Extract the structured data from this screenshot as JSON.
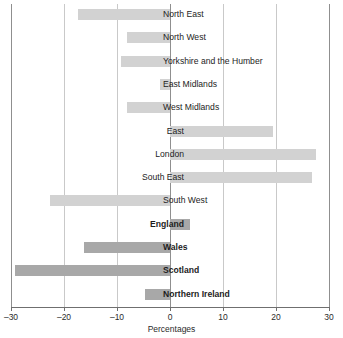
{
  "chart_data": {
    "type": "bar",
    "orientation": "horizontal",
    "title": "",
    "subtitle": "",
    "xlabel": "Percentages",
    "ylabel": "",
    "xlim": [
      -30,
      30
    ],
    "tick_labels": [
      "–30",
      "–20",
      "–10",
      "0",
      "10",
      "20",
      "30"
    ],
    "tick_values": [
      -30,
      -20,
      -10,
      0,
      10,
      20,
      30
    ],
    "grid": true,
    "legend": "none",
    "categories": [
      "North East",
      "North West",
      "Yorkshire  and the Humber",
      "East Midlands",
      "West Midlands",
      "East",
      "London",
      "South East",
      "South West",
      "England",
      "Wales",
      "Scotland",
      "Northern Ireland"
    ],
    "values": [
      -17.3,
      -8.2,
      -9.2,
      -1.9,
      -8.2,
      19.4,
      27.6,
      26.8,
      -22.6,
      3.8,
      -16.2,
      -29.3,
      -4.8
    ],
    "series": [
      {
        "name": "Percentage change",
        "values": [
          -17.3,
          -8.2,
          -9.2,
          -1.9,
          -8.2,
          19.4,
          27.6,
          26.8,
          -22.6,
          3.8,
          -16.2,
          -29.3,
          -4.8
        ]
      }
    ],
    "bar_styles": [
      "region",
      "region",
      "region",
      "region",
      "region",
      "region",
      "region",
      "region",
      "region",
      "country",
      "country",
      "country",
      "country"
    ],
    "bold_labels": [
      false,
      false,
      false,
      false,
      false,
      false,
      false,
      false,
      false,
      true,
      true,
      true,
      true
    ],
    "colors": {
      "region_bar": "#d2d2d2",
      "country_bar": "#a8a8a8",
      "gridline": "#c9c9c9",
      "axis": "#6f6f6f",
      "text": "#1d1d1d"
    }
  },
  "rows": [
    {
      "label": "North East",
      "value": -17.3,
      "style": "region",
      "bold": false
    },
    {
      "label": "North West",
      "value": -8.2,
      "style": "region",
      "bold": false
    },
    {
      "label": "Yorkshire  and the Humber",
      "value": -9.2,
      "style": "region",
      "bold": false
    },
    {
      "label": "East Midlands",
      "value": -1.9,
      "style": "region",
      "bold": false
    },
    {
      "label": "West Midlands",
      "value": -8.2,
      "style": "region",
      "bold": false
    },
    {
      "label": "East",
      "value": 19.4,
      "style": "region",
      "bold": false
    },
    {
      "label": "London",
      "value": 27.6,
      "style": "region",
      "bold": false
    },
    {
      "label": "South East",
      "value": 26.8,
      "style": "region",
      "bold": false
    },
    {
      "label": "South West",
      "value": -22.6,
      "style": "region",
      "bold": false
    },
    {
      "label": "England",
      "value": 3.8,
      "style": "country",
      "bold": true
    },
    {
      "label": "Wales",
      "value": -16.2,
      "style": "country",
      "bold": true
    },
    {
      "label": "Scotland",
      "value": -29.3,
      "style": "country",
      "bold": true
    },
    {
      "label": "Northern Ireland",
      "value": -4.8,
      "style": "country",
      "bold": true
    }
  ],
  "axis": {
    "title": "Percentages",
    "ticks": [
      "–30",
      "–20",
      "–10",
      "0",
      "10",
      "20",
      "30"
    ]
  }
}
